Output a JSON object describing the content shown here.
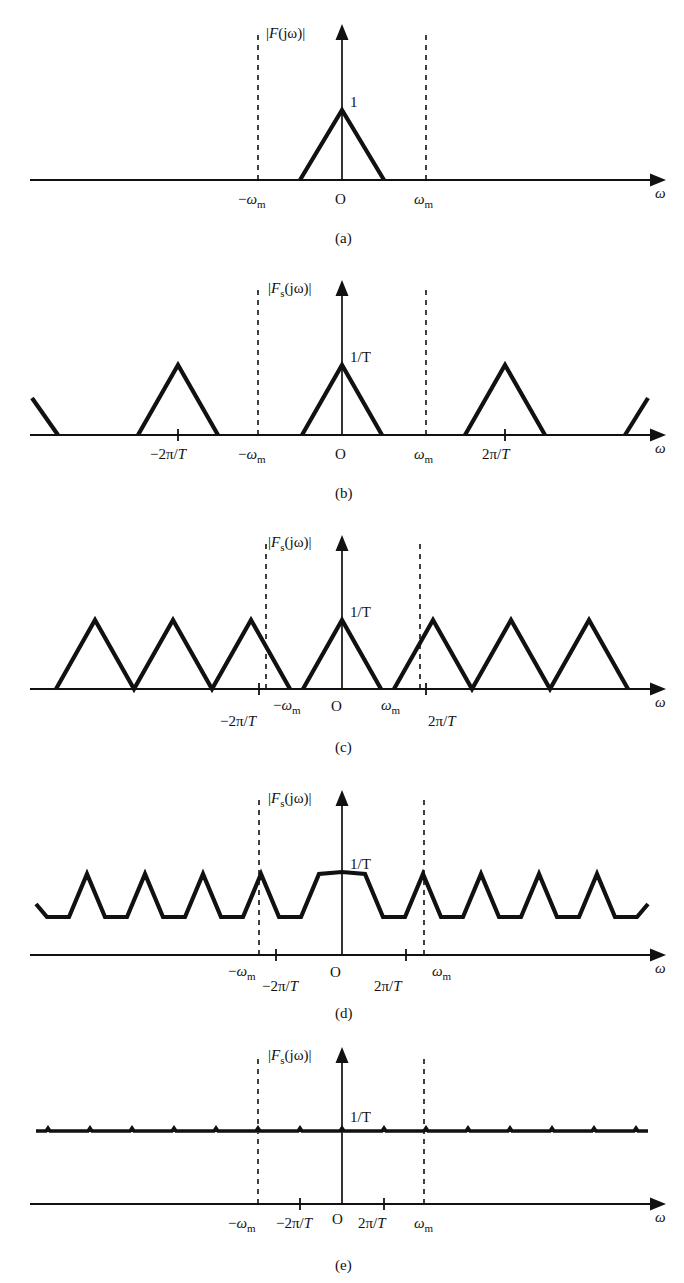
{
  "figure": {
    "kind": "spectrum-sampling-figure",
    "ink_color": "#111111",
    "background": "#ffffff",
    "omega_axis_label": "ω",
    "origin_label": "O",
    "panels": [
      {
        "id": "a",
        "caption": "(a)",
        "vertical_label": "|F(jω)|",
        "vertical_label_italic_part": "F",
        "peak_label": "1",
        "tick_labels": [
          "−ω",
          "m",
          "O",
          "ω",
          "m"
        ],
        "left_band_label": "−ωₘ",
        "right_band_label": "ωₘ",
        "description": "single triangular spectrum of the original signal, bandlimited to omega_m"
      },
      {
        "id": "b",
        "caption": "(b)",
        "vertical_label": "|Fₛ(jω)|",
        "peak_label": "1/T",
        "left_band_label": "−ωₘ",
        "right_band_label": "ωₘ",
        "left_harmonic_label": "−2π/T",
        "right_harmonic_label": "2π/T",
        "description": "sampled spectrum, no overlap (oversampled), replicas separated by 2pi/T"
      },
      {
        "id": "c",
        "caption": "(c)",
        "vertical_label": "|Fₛ(jω)|",
        "peak_label": "1/T",
        "left_band_label": "−ωₘ",
        "right_band_label": "ωₘ",
        "left_harmonic_label": "−2π/T",
        "right_harmonic_label": "2π/T",
        "description": "critical sampling, replicas just touch (Nyquist rate)"
      },
      {
        "id": "d",
        "caption": "(d)",
        "vertical_label": "|Fₛ(jω)|",
        "peak_label": "1/T",
        "left_band_label": "−ωₘ",
        "right_band_label": "ωₘ",
        "left_harmonic_label": "−2π/T",
        "right_harmonic_label": "2π/T",
        "description": "undersampling, replicas overlap causing aliasing, spectrum becomes a shallow zigzag"
      },
      {
        "id": "e",
        "caption": "(e)",
        "vertical_label": "|Fₛ(jω)|",
        "peak_label": "1/T",
        "left_band_label": "−ωₘ",
        "right_band_label": "ωₘ",
        "left_harmonic_label": "−2π/T",
        "right_harmonic_label": "2π/T",
        "description": "extreme undersampling, overlapped replicas sum to a nearly constant flat spectrum"
      }
    ]
  }
}
